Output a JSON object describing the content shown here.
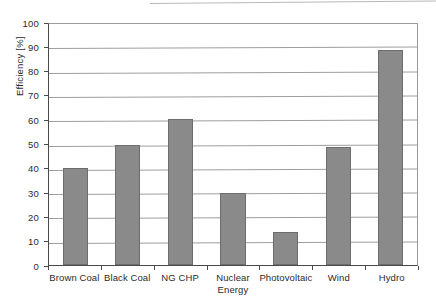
{
  "chart_data": {
    "type": "bar",
    "title": "",
    "xlabel": "",
    "ylabel": "Efficiency [%]",
    "ylim": [
      0,
      100
    ],
    "ytick_step": 10,
    "yticks": [
      100,
      90,
      80,
      70,
      60,
      50,
      40,
      30,
      20,
      10,
      0
    ],
    "ytick_labels": [
      "100",
      "90",
      "80",
      "70",
      "60",
      "50",
      "40",
      "30",
      "20",
      "10",
      "0"
    ],
    "grid": true,
    "grid_axis": "y",
    "legend": false,
    "categories": [
      "Brown Coal",
      "Black Coal",
      "NG CHP",
      "Nuclear Energy",
      "Photovoltaic",
      "Wind",
      "Hydro"
    ],
    "category_lines": [
      [
        "Brown Coal"
      ],
      [
        "Black Coal"
      ],
      [
        "NG CHP"
      ],
      [
        "Nuclear",
        "Energy"
      ],
      [
        "Photovoltaic"
      ],
      [
        "Wind"
      ],
      [
        "Hydro"
      ]
    ],
    "values": [
      40,
      49.5,
      60,
      29.5,
      13.5,
      48.5,
      88.5
    ],
    "bar_color": "#8a8a8a",
    "bar_edge_color": "#6d6d6d",
    "gridline_color": "#9e9e9e",
    "axis_color": "#4a4a4a",
    "background_color": "#ffffff"
  }
}
